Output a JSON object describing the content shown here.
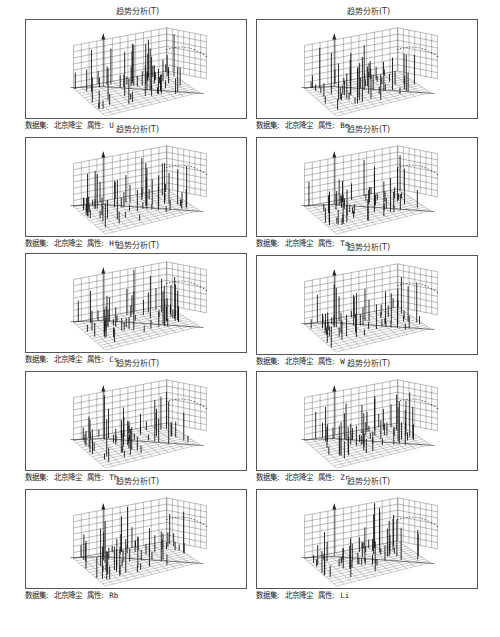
{
  "figure": {
    "panel_title": "趋势分析(T)",
    "dataset_label": "数据集:",
    "dataset_value": "北京降尘",
    "attribute_label": "属性:",
    "panels": [
      {
        "attribute": "U"
      },
      {
        "attribute": "Be"
      },
      {
        "attribute": "Hf"
      },
      {
        "attribute": "Ta"
      },
      {
        "attribute": "Cs"
      },
      {
        "attribute": "W"
      },
      {
        "attribute": "Th"
      },
      {
        "attribute": "Zr"
      },
      {
        "attribute": "Rb"
      },
      {
        "attribute": "Li"
      }
    ]
  },
  "chart_data": [
    {
      "type": "3d-trend",
      "title": "趋势分析(T)",
      "dataset": "北京降尘",
      "attribute": "U",
      "grid": true
    },
    {
      "type": "3d-trend",
      "title": "趋势分析(T)",
      "dataset": "北京降尘",
      "attribute": "Be",
      "grid": true
    },
    {
      "type": "3d-trend",
      "title": "趋势分析(T)",
      "dataset": "北京降尘",
      "attribute": "Hf",
      "grid": true
    },
    {
      "type": "3d-trend",
      "title": "趋势分析(T)",
      "dataset": "北京降尘",
      "attribute": "Ta",
      "grid": true
    },
    {
      "type": "3d-trend",
      "title": "趋势分析(T)",
      "dataset": "北京降尘",
      "attribute": "Cs",
      "grid": true
    },
    {
      "type": "3d-trend",
      "title": "趋势分析(T)",
      "dataset": "北京降尘",
      "attribute": "W",
      "grid": true
    },
    {
      "type": "3d-trend",
      "title": "趋势分析(T)",
      "dataset": "北京降尘",
      "attribute": "Th",
      "grid": true
    },
    {
      "type": "3d-trend",
      "title": "趋势分析(T)",
      "dataset": "北京降尘",
      "attribute": "Zr",
      "grid": true
    },
    {
      "type": "3d-trend",
      "title": "趋势分析(T)",
      "dataset": "北京降尘",
      "attribute": "Rb",
      "grid": true
    },
    {
      "type": "3d-trend",
      "title": "趋势分析(T)",
      "dataset": "北京降尘",
      "attribute": "Li",
      "grid": true
    }
  ]
}
